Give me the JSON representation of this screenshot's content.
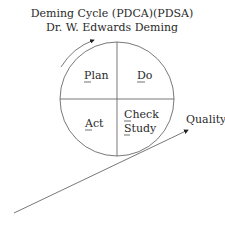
{
  "title": {
    "line1": "Deming Cycle (PDCA)(PDSA)",
    "line2": "Dr. W. Edwards Deming"
  },
  "quadrants": {
    "top_left": {
      "label": "Plan",
      "underline": "P"
    },
    "top_right": {
      "label": "Do",
      "underline": "D"
    },
    "bottom_left": {
      "label": "Act",
      "underline": "A"
    },
    "bottom_right": {
      "label_line1": "Check",
      "label_line2": "Study",
      "underline1": "C",
      "underline2": "S"
    }
  },
  "quality_arrow": {
    "label": "Quality"
  },
  "colors": {
    "stroke": "#555555",
    "text": "#2a2a2a",
    "background": "#ffffff"
  }
}
